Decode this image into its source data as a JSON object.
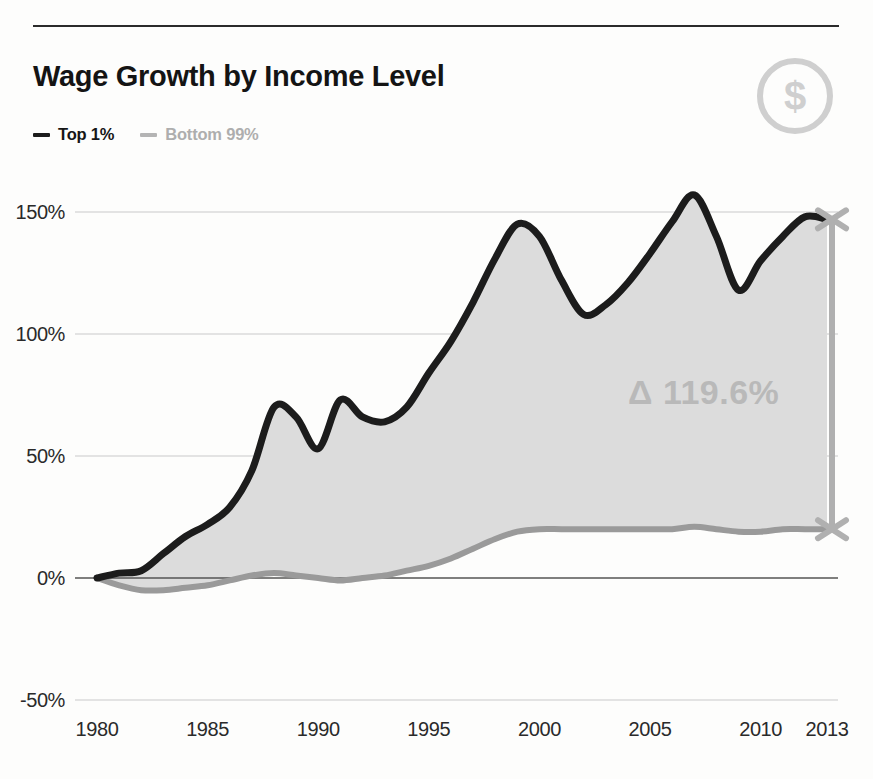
{
  "header": {
    "title": "Wage Growth by Income Level",
    "icon": "dollar-coin-icon",
    "icon_glyph": "$"
  },
  "legend": {
    "position": "top-left",
    "items": [
      {
        "label": "Top 1%",
        "color": "#1c1c1c"
      },
      {
        "label": "Bottom 99%",
        "color": "#b4b4b4"
      }
    ]
  },
  "annotation": {
    "text": "Δ 119.6%",
    "color": "#b9b9b9"
  },
  "colors": {
    "top_line": "#1c1c1c",
    "bottom_line": "#9a9a9a",
    "fill": "#dcdcdc",
    "grid": "#c9c9c9",
    "axis": "#555555",
    "bracket": "#b0b0b0",
    "background": "#fdfdfc"
  },
  "chart_data": {
    "type": "area",
    "title": "Wage Growth by Income Level",
    "xlabel": "",
    "ylabel": "",
    "xlim": [
      1980,
      2013
    ],
    "ylim": [
      -50,
      165
    ],
    "grid": true,
    "legend_position": "top-left",
    "ytick_labels": [
      "150%",
      "100%",
      "50%",
      "0%",
      "-50%"
    ],
    "ytick_values": [
      150,
      100,
      50,
      0,
      -50
    ],
    "xtick_labels": [
      "1980",
      "1985",
      "1990",
      "1995",
      "2000",
      "2005",
      "2010",
      "2013"
    ],
    "xtick_values": [
      1980,
      1985,
      1990,
      1995,
      2000,
      2005,
      2010,
      2013
    ],
    "annotation": "Δ 119.6%",
    "x": [
      1980,
      1981,
      1982,
      1983,
      1984,
      1985,
      1986,
      1987,
      1988,
      1989,
      1990,
      1991,
      1992,
      1993,
      1994,
      1995,
      1996,
      1997,
      1998,
      1999,
      2000,
      2001,
      2002,
      2003,
      2004,
      2005,
      2006,
      2007,
      2008,
      2009,
      2010,
      2011,
      2012,
      2013
    ],
    "series": [
      {
        "name": "Top 1%",
        "values": [
          0,
          2,
          3,
          10,
          17,
          22,
          29,
          44,
          70,
          66,
          53,
          73,
          66,
          64,
          70,
          84,
          97,
          113,
          131,
          145,
          140,
          122,
          108,
          112,
          121,
          133,
          146,
          157,
          140,
          118,
          130,
          140,
          148,
          147
        ]
      },
      {
        "name": "Bottom 99%",
        "values": [
          0,
          -3,
          -5,
          -5,
          -4,
          -3,
          -1,
          1,
          2,
          1,
          0,
          -1,
          0,
          1,
          3,
          5,
          8,
          12,
          16,
          19,
          20,
          20,
          20,
          20,
          20,
          20,
          20,
          21,
          20,
          19,
          19,
          20,
          20,
          20
        ]
      }
    ]
  }
}
